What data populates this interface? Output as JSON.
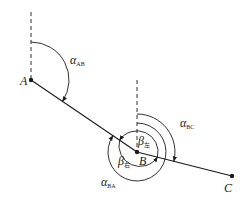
{
  "diagram": {
    "points": [
      {
        "name": "A",
        "x": 30,
        "y": 80,
        "label": "A"
      },
      {
        "name": "B",
        "x": 136,
        "y": 152,
        "label": "B"
      },
      {
        "name": "C",
        "x": 232,
        "y": 176,
        "label": "C"
      }
    ],
    "angles": {
      "alpha_ab": {
        "symbol": "α",
        "subscript": "AB"
      },
      "alpha_bc": {
        "symbol": "α",
        "subscript": "BC"
      },
      "alpha_ba": {
        "symbol": "α",
        "subscript": "BA"
      },
      "beta_left": {
        "symbol": "β",
        "subscript": "左"
      },
      "beta_right": {
        "symbol": "β",
        "subscript": "右"
      }
    },
    "colors": {
      "line": "#1a1a1a",
      "background": "#ffffff"
    }
  }
}
